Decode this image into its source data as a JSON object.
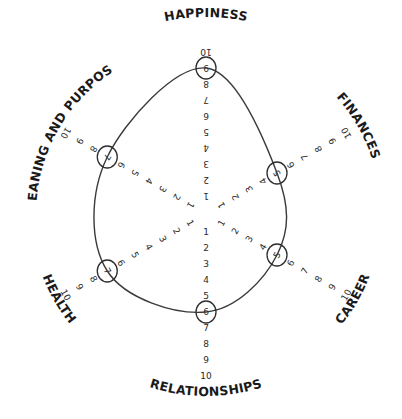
{
  "scale": {
    "min": 1,
    "max": 10
  },
  "colors": {
    "ink": "#2a2a2a",
    "label": "#1a1a1a",
    "curve": "#3a3a3a",
    "background": "#ffffff"
  },
  "chart_data": {
    "type": "radar",
    "title": "",
    "categories": [
      "HAPPINESS",
      "FINANCES",
      "CAREER",
      "RELATIONSHIPS",
      "HEALTH",
      "MEANING AND PURPOSE"
    ],
    "tick_labels": [
      "1",
      "2",
      "3",
      "4",
      "5",
      "6",
      "7",
      "8",
      "9",
      "10"
    ],
    "range": [
      1,
      10
    ],
    "series": [
      {
        "name": "Self rating",
        "values": [
          9,
          5,
          5,
          6,
          7,
          7
        ]
      }
    ],
    "legend": "none",
    "grid": false
  }
}
